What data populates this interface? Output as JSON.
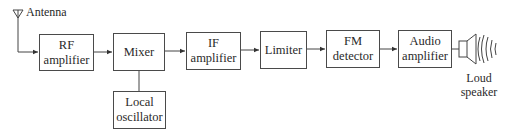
{
  "diagram": {
    "antenna": {
      "label": "Antenna"
    },
    "blocks": [
      {
        "id": "rf",
        "line1": "RF",
        "line2": "amplifier"
      },
      {
        "id": "mixer",
        "line1": "Mixer",
        "line2": ""
      },
      {
        "id": "lo",
        "line1": "Local",
        "line2": "oscillator"
      },
      {
        "id": "if",
        "line1": "IF",
        "line2": "amplifier"
      },
      {
        "id": "limiter",
        "line1": "Limiter",
        "line2": ""
      },
      {
        "id": "fm",
        "line1": "FM",
        "line2": "detector"
      },
      {
        "id": "audio",
        "line1": "Audio",
        "line2": "amplifier"
      }
    ],
    "speaker": {
      "line1": "Loud",
      "line2": "speaker"
    },
    "colors": {
      "line": "#4a4a4a",
      "text": "#2a2a2a",
      "background": "#ffffff"
    }
  }
}
